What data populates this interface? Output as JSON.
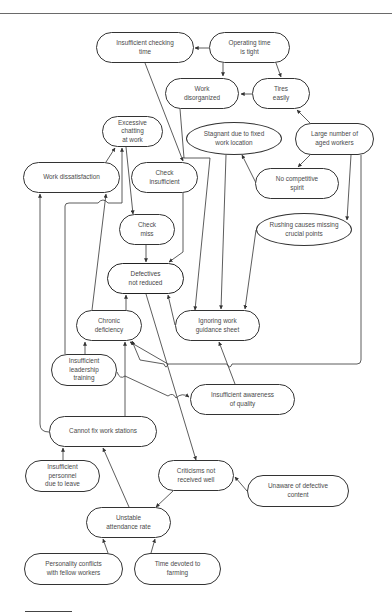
{
  "diagram": {
    "type": "cause-and-effect relations diagram",
    "central_problem": "Defectives not reduced",
    "nodes": [
      {
        "id": "insufficient-checking-time",
        "label": "Insufficient checking\ntime",
        "shape": "rounded",
        "x": 96,
        "y": 32,
        "w": 98,
        "h": 31
      },
      {
        "id": "operating-time-tight",
        "label": "Operating time\nis tight",
        "shape": "rounded",
        "x": 209,
        "y": 32,
        "w": 81,
        "h": 31
      },
      {
        "id": "work-disorganized",
        "label": "Work\ndisorganized",
        "shape": "rounded",
        "x": 165,
        "y": 78,
        "w": 74,
        "h": 31
      },
      {
        "id": "tires-easily",
        "label": "Tires\neasily",
        "shape": "rounded",
        "x": 252,
        "y": 78,
        "w": 58,
        "h": 31
      },
      {
        "id": "excessive-chatting",
        "label": "Excessive\nchatting\nat work",
        "shape": "rounded",
        "x": 102,
        "y": 116,
        "w": 61,
        "h": 31
      },
      {
        "id": "stagnant-fixed-location",
        "label": "Stagnant due to fixed\nwork location",
        "shape": "ellipse",
        "x": 186,
        "y": 122,
        "w": 96,
        "h": 33
      },
      {
        "id": "large-aged-workers",
        "label": "Large number of\naged workers",
        "shape": "rounded",
        "x": 295,
        "y": 123,
        "w": 79,
        "h": 32
      },
      {
        "id": "work-dissatisfaction",
        "label": "Work dissatisfaction",
        "shape": "rounded",
        "x": 23,
        "y": 162,
        "w": 97,
        "h": 31
      },
      {
        "id": "check-insufficient",
        "label": "Check\ninsufficient",
        "shape": "rounded",
        "x": 131,
        "y": 162,
        "w": 67,
        "h": 31
      },
      {
        "id": "no-competitive-spirit",
        "label": "No competitive\nspirit",
        "shape": "rounded",
        "x": 255,
        "y": 168,
        "w": 84,
        "h": 31
      },
      {
        "id": "check-miss",
        "label": "Check\nmiss",
        "shape": "rounded",
        "x": 119,
        "y": 214,
        "w": 56,
        "h": 31
      },
      {
        "id": "rushing-missing-points",
        "label": "Rushing causes missing\ncrucial points",
        "shape": "ellipse",
        "x": 256,
        "y": 213,
        "w": 96,
        "h": 33
      },
      {
        "id": "defectives-not-reduced",
        "label": "Defectives\nnot reduced",
        "shape": "rounded",
        "x": 107,
        "y": 263,
        "w": 77,
        "h": 31,
        "focus": true
      },
      {
        "id": "chronic-deficiency",
        "label": "Chronic\ndeficiency",
        "shape": "rounded",
        "x": 76,
        "y": 310,
        "w": 66,
        "h": 31
      },
      {
        "id": "ignoring-guidance-sheet",
        "label": "Ignoring work\nguidance sheet",
        "shape": "rounded",
        "x": 175,
        "y": 310,
        "w": 85,
        "h": 31
      },
      {
        "id": "insufficient-leadership-training",
        "label": "Insufficient\nleadership\ntraining",
        "shape": "rounded",
        "x": 51,
        "y": 354,
        "w": 66,
        "h": 32
      },
      {
        "id": "insufficient-awareness-quality",
        "label": "Insufficient awareness\nof quality",
        "shape": "rounded",
        "x": 190,
        "y": 384,
        "w": 105,
        "h": 31
      },
      {
        "id": "cannot-fix-work-stations",
        "label": "Cannot fix work stations",
        "shape": "rounded",
        "x": 49,
        "y": 416,
        "w": 108,
        "h": 31
      },
      {
        "id": "insufficient-personnel-leave",
        "label": "Insufficient\npersonnel\ndue to leave",
        "shape": "rounded",
        "x": 25,
        "y": 460,
        "w": 75,
        "h": 32
      },
      {
        "id": "criticisms-not-received",
        "label": "Criticisms not\nreceived well",
        "shape": "rounded",
        "x": 158,
        "y": 460,
        "w": 76,
        "h": 31
      },
      {
        "id": "unaware-defective-content",
        "label": "Unaware of defective\ncontent",
        "shape": "rounded",
        "x": 247,
        "y": 475,
        "w": 102,
        "h": 32
      },
      {
        "id": "unstable-attendance",
        "label": "Unstable\nattendance rate",
        "shape": "rounded",
        "x": 86,
        "y": 507,
        "w": 85,
        "h": 31
      },
      {
        "id": "personality-conflicts",
        "label": "Personality conflicts\nwith fellow workers",
        "shape": "rounded",
        "x": 24,
        "y": 553,
        "w": 99,
        "h": 32
      },
      {
        "id": "time-devoted-farming",
        "label": "Time devoted to\nfarming",
        "shape": "rounded",
        "x": 134,
        "y": 553,
        "w": 87,
        "h": 32
      }
    ],
    "edges": [
      {
        "from": "operating-time-tight",
        "to": "insufficient-checking-time"
      },
      {
        "from": "operating-time-tight",
        "to": "work-disorganized"
      },
      {
        "from": "operating-time-tight",
        "to": "tires-easily"
      },
      {
        "from": "tires-easily",
        "to": "work-disorganized"
      },
      {
        "from": "large-aged-workers",
        "to": "tires-easily"
      },
      {
        "from": "large-aged-workers",
        "to": "no-competitive-spirit"
      },
      {
        "from": "large-aged-workers",
        "to": "rushing-missing-points"
      },
      {
        "from": "large-aged-workers",
        "to": "defectives-not-reduced"
      },
      {
        "from": "no-competitive-spirit",
        "to": "stagnant-fixed-location"
      },
      {
        "from": "stagnant-fixed-location",
        "to": "ignoring-guidance-sheet"
      },
      {
        "from": "rushing-missing-points",
        "to": "ignoring-guidance-sheet"
      },
      {
        "from": "work-disorganized",
        "to": "ignoring-guidance-sheet"
      },
      {
        "from": "insufficient-checking-time",
        "to": "check-insufficient"
      },
      {
        "from": "check-insufficient",
        "to": "defectives-not-reduced"
      },
      {
        "from": "excessive-chatting",
        "to": "check-miss"
      },
      {
        "from": "check-miss",
        "to": "defectives-not-reduced"
      },
      {
        "from": "work-dissatisfaction",
        "to": "excessive-chatting"
      },
      {
        "from": "chronic-deficiency",
        "to": "excessive-chatting"
      },
      {
        "from": "insufficient-leadership-training",
        "to": "excessive-chatting"
      },
      {
        "from": "chronic-deficiency",
        "to": "defectives-not-reduced"
      },
      {
        "from": "ignoring-guidance-sheet",
        "to": "defectives-not-reduced"
      },
      {
        "from": "insufficient-leadership-training",
        "to": "chronic-deficiency"
      },
      {
        "from": "insufficient-leadership-training",
        "to": "insufficient-awareness-quality"
      },
      {
        "from": "insufficient-awareness-quality",
        "to": "ignoring-guidance-sheet"
      },
      {
        "from": "cannot-fix-work-stations",
        "to": "chronic-deficiency"
      },
      {
        "from": "cannot-fix-work-stations",
        "to": "work-dissatisfaction"
      },
      {
        "from": "insufficient-personnel-leave",
        "to": "cannot-fix-work-stations"
      },
      {
        "from": "unstable-attendance",
        "to": "cannot-fix-work-stations"
      },
      {
        "from": "defectives-not-reduced",
        "to": "criticisms-not-received"
      },
      {
        "from": "unaware-defective-content",
        "to": "criticisms-not-received"
      },
      {
        "from": "criticisms-not-received",
        "to": "unstable-attendance"
      },
      {
        "from": "personality-conflicts",
        "to": "unstable-attendance"
      },
      {
        "from": "time-devoted-farming",
        "to": "unstable-attendance"
      }
    ]
  }
}
